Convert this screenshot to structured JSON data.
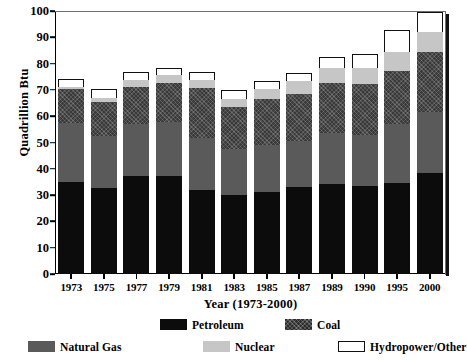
{
  "chart_data": {
    "type": "bar",
    "subtype": "stacked-vertical",
    "title": "",
    "title_note": "title row is cropped off the top edge of the screenshot",
    "xlabel": "Year (1973-2000)",
    "ylabel": "Quadrillion Btu",
    "ylim": [
      0,
      100
    ],
    "ytick_step": 10,
    "ytick_labels": [
      "0",
      "10",
      "20",
      "30",
      "40",
      "50",
      "60",
      "70",
      "80",
      "90",
      "100"
    ],
    "grid": false,
    "legend_position": "bottom",
    "categories": [
      "1973",
      "1975",
      "1977",
      "1979",
      "1981",
      "1983",
      "1985",
      "1987",
      "1989",
      "1990",
      "1995",
      "2000"
    ],
    "stack_order_bottom_to_top": [
      "Petroleum",
      "Natural Gas",
      "Coal",
      "Nuclear",
      "Hydropower/Other"
    ],
    "series": [
      {
        "name": "Petroleum",
        "color": "#0c0c0c",
        "values": [
          34.8,
          32.7,
          37.1,
          37.1,
          32.0,
          30.1,
          31.1,
          32.9,
          34.2,
          33.6,
          34.6,
          38.4
        ]
      },
      {
        "name": "Natural Gas",
        "color": "#5a5a5a",
        "values": [
          22.5,
          19.9,
          19.9,
          20.7,
          19.9,
          17.4,
          17.8,
          17.6,
          19.4,
          19.3,
          22.6,
          23.3
        ]
      },
      {
        "name": "Coal",
        "color": "#3a3a3a",
        "values": [
          13.0,
          12.7,
          14.1,
          15.0,
          19.0,
          15.9,
          17.5,
          18.0,
          19.0,
          19.2,
          20.1,
          22.6
        ]
      },
      {
        "name": "Nuclear",
        "color": "#c6c6c6",
        "values": [
          0.9,
          1.8,
          2.7,
          2.8,
          3.0,
          3.2,
          4.1,
          4.9,
          5.6,
          6.1,
          7.2,
          7.9
        ]
      },
      {
        "name": "Hydropower/Other",
        "color": "#ffffff",
        "values": [
          3.0,
          3.2,
          2.9,
          2.9,
          3.1,
          3.5,
          3.0,
          3.1,
          4.5,
          5.3,
          8.3,
          7.6
        ]
      }
    ],
    "totals": [
      74.2,
      70.3,
      76.7,
      78.5,
      77.0,
      70.1,
      73.5,
      76.5,
      82.7,
      83.5,
      92.8,
      99.8
    ]
  },
  "legend": {
    "items": [
      {
        "label": "Petroleum",
        "swatch": "sw-petroleum",
        "row": 1
      },
      {
        "label": "Coal",
        "swatch": "sw-coal",
        "row": 1
      },
      {
        "label": "Natural Gas",
        "swatch": "sw-gas",
        "row": 2
      },
      {
        "label": "Nuclear",
        "swatch": "sw-nuclear",
        "row": 2
      },
      {
        "label": "Hydropower/Other",
        "swatch": "sw-hydro",
        "row": 2
      }
    ]
  }
}
